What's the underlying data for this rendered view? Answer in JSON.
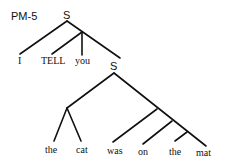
{
  "diagram": {
    "label": "PM-5",
    "root_node": "S",
    "embedded_node": "S",
    "top_words": [
      "I",
      "TELL",
      "you"
    ],
    "bottom_words": [
      "the",
      "cat",
      "was",
      "on",
      "the",
      "mat"
    ],
    "line_color": "#111111",
    "background": "#ffffff"
  }
}
